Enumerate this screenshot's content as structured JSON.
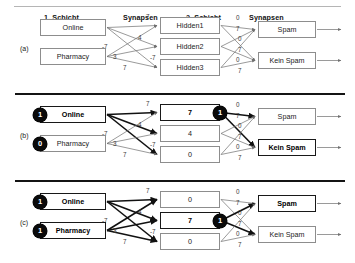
{
  "figure": {
    "headers": [
      {
        "label": "1. Schicht",
        "x": 44
      },
      {
        "label": "Synapsen",
        "x": 123
      },
      {
        "label": "2. Schicht",
        "x": 186
      },
      {
        "label": "Synapsen",
        "x": 249
      }
    ]
  },
  "layout": {
    "input_x": 40,
    "input_w": 66,
    "hidden_x": 160,
    "hidden_w": 60,
    "output_x": 258,
    "output_w": 58,
    "box_h": 17,
    "arrow_end": 341
  },
  "weights": {
    "input_to_hidden": [
      "7",
      "4",
      "-7",
      "3",
      "-7",
      "7"
    ],
    "hidden_to_output": [
      "0",
      "7",
      "0",
      "7",
      "0",
      "7"
    ]
  },
  "sections": [
    {
      "id": "a",
      "label": "(a)",
      "top": 12,
      "input_nodes": [
        {
          "label": "Online",
          "value": null,
          "active": false
        },
        {
          "label": "Pharmacy",
          "value": null,
          "active": false
        }
      ],
      "hidden_nodes": [
        {
          "label": "Hidden1",
          "value": null,
          "active": false
        },
        {
          "label": "Hidden2",
          "value": null,
          "active": false
        },
        {
          "label": "Hidden3",
          "value": null,
          "active": false
        }
      ],
      "output_nodes": [
        {
          "label": "Spam",
          "active": false
        },
        {
          "label": "Kein Spam",
          "active": false
        }
      ]
    },
    {
      "id": "b",
      "label": "(b)",
      "top": 99,
      "input_nodes": [
        {
          "label": "Online",
          "value": "1",
          "active": true
        },
        {
          "label": "Pharmacy",
          "value": "0",
          "active": false
        }
      ],
      "hidden_nodes": [
        {
          "label": "7",
          "value": "1",
          "active": true
        },
        {
          "label": "4",
          "value": null,
          "active": false
        },
        {
          "label": "0",
          "value": null,
          "active": false
        }
      ],
      "output_nodes": [
        {
          "label": "Spam",
          "active": false
        },
        {
          "label": "Kein Spam",
          "active": true
        }
      ]
    },
    {
      "id": "c",
      "label": "(c)",
      "top": 186,
      "input_nodes": [
        {
          "label": "Online",
          "value": "1",
          "active": true
        },
        {
          "label": "Pharmacy",
          "value": "1",
          "active": true
        }
      ],
      "hidden_nodes": [
        {
          "label": "0",
          "value": null,
          "active": false
        },
        {
          "label": "7",
          "value": "1",
          "active": true
        },
        {
          "label": "0",
          "value": null,
          "active": false
        }
      ],
      "output_nodes": [
        {
          "label": "Spam",
          "active": true
        },
        {
          "label": "Kein Spam",
          "active": false
        }
      ]
    }
  ],
  "dividers": [
    {
      "top": 93,
      "left": 15,
      "width": 330
    },
    {
      "top": 180,
      "left": 15,
      "width": 330
    }
  ],
  "colors": {
    "ink": "#1a1a1a",
    "box_border": "#8d8d8d",
    "box_border_active": "#181818",
    "badge_bg": "#0a0a0a",
    "wire": "#6e6e6e",
    "wire_active": "#111111",
    "rule": "#141414"
  }
}
